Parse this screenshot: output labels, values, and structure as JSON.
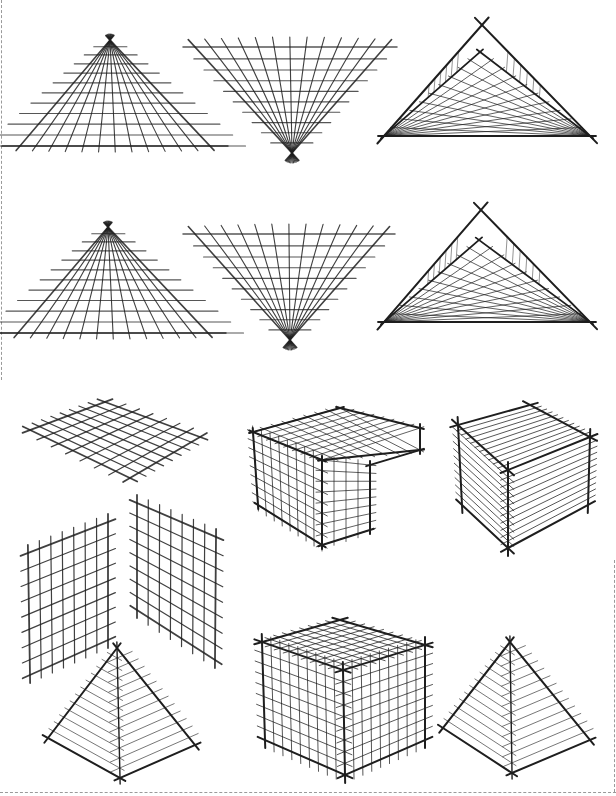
{
  "page": {
    "background": "#ffffff",
    "ink": "#1e1e1e",
    "light_ink": "#555555",
    "border_color": "#9a9a9a"
  },
  "figures": [
    {
      "id": "fan-triangle-up-1",
      "kind": "fan-up",
      "apex": [
        110,
        40
      ],
      "base_y": 146,
      "base_left": 20,
      "base_right": 210,
      "rays": 13,
      "rows": 11
    },
    {
      "id": "fan-triangle-down-1",
      "kind": "fan-down",
      "vertex": [
        292,
        153
      ],
      "top_y": 47,
      "top_left": 195,
      "top_right": 385,
      "rays": 13,
      "rows": 10
    },
    {
      "id": "nested-triangle-1",
      "kind": "nested",
      "outer_apex": [
        482,
        25
      ],
      "inner_apex": [
        480,
        52
      ],
      "base_left": [
        384,
        136
      ],
      "base_right": [
        590,
        136
      ],
      "lines": 9
    },
    {
      "id": "fan-triangle-up-2",
      "kind": "fan-up",
      "apex": [
        108,
        227
      ],
      "base_y": 333,
      "base_left": 18,
      "base_right": 208,
      "rays": 13,
      "rows": 11
    },
    {
      "id": "fan-triangle-down-2",
      "kind": "fan-down",
      "vertex": [
        290,
        340
      ],
      "top_y": 234,
      "top_left": 195,
      "top_right": 383,
      "rays": 13,
      "rows": 10
    },
    {
      "id": "nested-triangle-2",
      "kind": "nested",
      "outer_apex": [
        481,
        210
      ],
      "inner_apex": [
        479,
        240
      ],
      "base_left": [
        384,
        322
      ],
      "base_right": [
        590,
        322
      ],
      "lines": 9
    },
    {
      "id": "ground-plane-grid",
      "kind": "quad-grid",
      "corners": [
        [
          30,
          430
        ],
        [
          105,
          402
        ],
        [
          200,
          437
        ],
        [
          130,
          478
        ]
      ],
      "u": 8,
      "v": 7
    },
    {
      "id": "l-shaped-block",
      "kind": "l-block",
      "points": {
        "tl": [
          253,
          432
        ],
        "tb": [
          340,
          408
        ],
        "tr": [
          420,
          428
        ],
        "ftop": [
          322,
          460
        ],
        "fbot": [
          322,
          545
        ],
        "lbot": [
          258,
          505
        ],
        "step_top": [
          370,
          465
        ],
        "step_bot": [
          370,
          530
        ],
        "tr_low": [
          420,
          450
        ]
      }
    },
    {
      "id": "hatched-cube",
      "kind": "hatched-cube",
      "points": {
        "tl": [
          458,
          425
        ],
        "tb": [
          530,
          405
        ],
        "tr": [
          590,
          437
        ],
        "ftop": [
          508,
          470
        ],
        "fbot": [
          508,
          548
        ],
        "lbot": [
          462,
          505
        ],
        "rbot": [
          588,
          505
        ]
      },
      "hatches": 11
    },
    {
      "id": "wall-plane-left",
      "kind": "quad-grid",
      "corners": [
        [
          28,
          553
        ],
        [
          108,
          522
        ],
        [
          108,
          640
        ],
        [
          30,
          675
        ]
      ],
      "u": 7,
      "v": 8
    },
    {
      "id": "wall-plane-right",
      "kind": "quad-grid",
      "corners": [
        [
          137,
          503
        ],
        [
          216,
          537
        ],
        [
          215,
          660
        ],
        [
          137,
          610
        ]
      ],
      "u": 7,
      "v": 8
    },
    {
      "id": "grid-cube",
      "kind": "grid-cube",
      "points": {
        "tl": [
          262,
          642
        ],
        "tb": [
          340,
          620
        ],
        "tr": [
          425,
          645
        ],
        "ftop": [
          343,
          670
        ],
        "fbot": [
          345,
          775
        ],
        "lbot": [
          265,
          740
        ],
        "rbot": [
          425,
          740
        ]
      },
      "divs": 9
    },
    {
      "id": "pyramid-left",
      "kind": "pyramid",
      "apex": [
        117,
        648
      ],
      "left": [
        48,
        738
      ],
      "right": [
        195,
        745
      ],
      "bottom": [
        120,
        778
      ],
      "hatches": 13
    },
    {
      "id": "pyramid-right",
      "kind": "pyramid",
      "apex": [
        510,
        642
      ],
      "left": [
        443,
        728
      ],
      "right": [
        590,
        740
      ],
      "bottom": [
        512,
        773
      ],
      "hatches": 13
    }
  ]
}
